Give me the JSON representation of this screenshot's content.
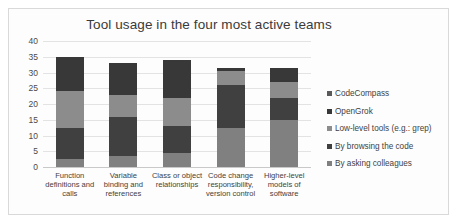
{
  "chart_data": {
    "type": "bar",
    "subtype": "stacked-bar",
    "title": "Tool usage in the four most active teams",
    "xlabel": "",
    "ylabel": "",
    "ylim": [
      0,
      40
    ],
    "yticks": [
      0,
      5,
      10,
      15,
      20,
      25,
      30,
      35,
      40
    ],
    "ytick_labels": [
      "0",
      "5",
      "10",
      "15",
      "20",
      "25",
      "30",
      "35",
      "40"
    ],
    "grid": true,
    "legend_position": "right",
    "categories": [
      "Function definitions and calls",
      "Variable binding and references",
      "Class or object relationships",
      "Code change responsibility, version control",
      "Higher-level models of software"
    ],
    "category_label_lines": [
      [
        "Function",
        "definitions and",
        "calls"
      ],
      [
        "Variable",
        "binding and",
        "references"
      ],
      [
        "Class or object",
        "relationships"
      ],
      [
        "Code change",
        "responsibility,",
        "version control"
      ],
      [
        "Higher-level",
        "models of",
        "software"
      ]
    ],
    "series": [
      {
        "name": "By asking colleagues",
        "color": "#808080",
        "values": [
          2.5,
          3.5,
          4.5,
          12.5,
          15.0
        ]
      },
      {
        "name": "By browsing the code",
        "color": "#404040",
        "values": [
          10.0,
          12.5,
          8.5,
          13.5,
          7.0
        ]
      },
      {
        "name": "Low-level tools (e.g.: grep)",
        "color": "#8c8c8c",
        "values": [
          11.5,
          7.0,
          9.0,
          4.5,
          5.0
        ]
      },
      {
        "name": "OpenGrok",
        "color": "#383838",
        "values": [
          11.0,
          10.0,
          12.0,
          1.0,
          4.5
        ]
      },
      {
        "name": "CodeCompass",
        "color": "#5a5a5a",
        "values": [
          0,
          0,
          0,
          0,
          0
        ]
      }
    ],
    "stack_order_bottom_to_top": [
      "By asking colleagues",
      "By browsing the code",
      "Low-level tools (e.g.: grep)",
      "OpenGrok",
      "CodeCompass"
    ],
    "totals": [
      35,
      33,
      34,
      31.5,
      31.5
    ],
    "legend_entries": [
      "CodeCompass",
      "OpenGrok",
      "Low-level tools (e.g.: grep)",
      "By browsing the code",
      "By asking colleagues"
    ],
    "legend_colors": [
      "#5a5a5a",
      "#383838",
      "#8c8c8c",
      "#404040",
      "#808080"
    ]
  }
}
